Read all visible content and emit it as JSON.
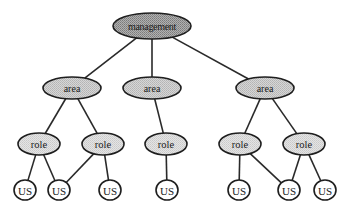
{
  "diagram": {
    "type": "hierarchy-tree",
    "colors": {
      "management_fill": "#9c9c9c",
      "area_fill": "#c9c9c9",
      "role_fill": "#dadada",
      "us_fill": "#ffffff",
      "stroke": "#1e1e1e"
    },
    "nodes": [
      {
        "id": "management",
        "label": "management",
        "level": "management",
        "cx": 152,
        "cy": 26,
        "rx": 39,
        "ry": 13
      },
      {
        "id": "area1",
        "label": "area",
        "level": "area",
        "cx": 72,
        "cy": 88,
        "rx": 29,
        "ry": 11
      },
      {
        "id": "area2",
        "label": "area",
        "level": "area",
        "cx": 152,
        "cy": 88,
        "rx": 29,
        "ry": 11
      },
      {
        "id": "area3",
        "label": "area",
        "level": "area",
        "cx": 265,
        "cy": 88,
        "rx": 29,
        "ry": 11
      },
      {
        "id": "role1",
        "label": "role",
        "level": "role",
        "cx": 39,
        "cy": 144,
        "rx": 21,
        "ry": 11
      },
      {
        "id": "role2",
        "label": "role",
        "level": "role",
        "cx": 103,
        "cy": 144,
        "rx": 21,
        "ry": 11
      },
      {
        "id": "role3",
        "label": "role",
        "level": "role",
        "cx": 166,
        "cy": 144,
        "rx": 21,
        "ry": 11
      },
      {
        "id": "role4",
        "label": "role",
        "level": "role",
        "cx": 240,
        "cy": 144,
        "rx": 21,
        "ry": 11
      },
      {
        "id": "role5",
        "label": "role",
        "level": "role",
        "cx": 304,
        "cy": 144,
        "rx": 21,
        "ry": 11
      },
      {
        "id": "us1",
        "label": "US",
        "level": "us",
        "cx": 25,
        "cy": 190,
        "rx": 11,
        "ry": 10
      },
      {
        "id": "us2",
        "label": "US",
        "level": "us",
        "cx": 59,
        "cy": 190,
        "rx": 11,
        "ry": 10
      },
      {
        "id": "us3",
        "label": "US",
        "level": "us",
        "cx": 110,
        "cy": 190,
        "rx": 11,
        "ry": 10
      },
      {
        "id": "us4",
        "label": "US",
        "level": "us",
        "cx": 167,
        "cy": 190,
        "rx": 11,
        "ry": 10
      },
      {
        "id": "us5",
        "label": "US",
        "level": "us",
        "cx": 239,
        "cy": 190,
        "rx": 11,
        "ry": 10
      },
      {
        "id": "us6",
        "label": "US",
        "level": "us",
        "cx": 289,
        "cy": 190,
        "rx": 11,
        "ry": 10
      },
      {
        "id": "us7",
        "label": "US",
        "level": "us",
        "cx": 325,
        "cy": 190,
        "rx": 11,
        "ry": 10
      }
    ],
    "edges": [
      {
        "from": "management",
        "to": "area1"
      },
      {
        "from": "management",
        "to": "area2"
      },
      {
        "from": "management",
        "to": "area3"
      },
      {
        "from": "area1",
        "to": "role1"
      },
      {
        "from": "area1",
        "to": "role2"
      },
      {
        "from": "area2",
        "to": "role3"
      },
      {
        "from": "area3",
        "to": "role4"
      },
      {
        "from": "area3",
        "to": "role5"
      },
      {
        "from": "role1",
        "to": "us1"
      },
      {
        "from": "role1",
        "to": "us2"
      },
      {
        "from": "role2",
        "to": "us2"
      },
      {
        "from": "role2",
        "to": "us3"
      },
      {
        "from": "role3",
        "to": "us4"
      },
      {
        "from": "role4",
        "to": "us5"
      },
      {
        "from": "role4",
        "to": "us6"
      },
      {
        "from": "role5",
        "to": "us6"
      },
      {
        "from": "role5",
        "to": "us7"
      }
    ]
  }
}
